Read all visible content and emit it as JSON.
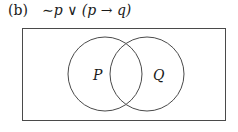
{
  "figure": {
    "label": "(b)",
    "formula": "∼p ∨ (p → q)"
  },
  "venn": {
    "sets": [
      {
        "name": "P"
      },
      {
        "name": "Q"
      }
    ],
    "line_color": "#4a4a4a",
    "shading": "none"
  }
}
